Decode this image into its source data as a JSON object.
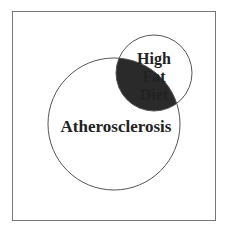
{
  "diagram": {
    "type": "venn",
    "sets": [
      {
        "label": "Atherosclerosis",
        "cx": 114,
        "cy": 124,
        "r": 66
      },
      {
        "label_lines": [
          "High",
          "Fat",
          "Diet"
        ],
        "cx": 154,
        "cy": 73,
        "r": 38
      }
    ],
    "intersection_fill": "#2a2a2a",
    "stroke_color": "#555555"
  }
}
